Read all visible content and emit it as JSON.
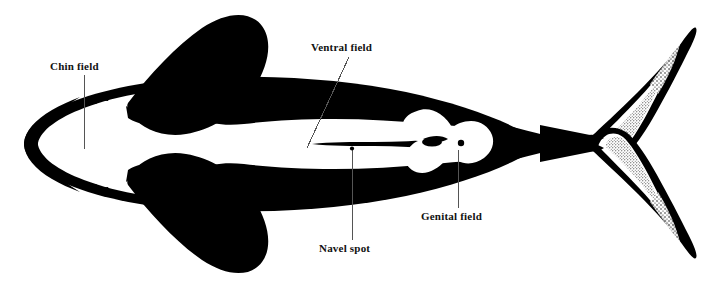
{
  "figure": {
    "background_color": "#ffffff",
    "ink_color": "#000000",
    "leader_line_color": "#555555",
    "width": 713,
    "height": 288
  },
  "annotations": [
    {
      "id": "chin-field",
      "label": "Chin field",
      "label_x": 50,
      "label_y": 61,
      "leader": {
        "x1": 84,
        "y1": 75,
        "x2": 84,
        "y2": 149
      }
    },
    {
      "id": "ventral-field",
      "label": "Ventral field",
      "label_x": 311,
      "label_y": 42,
      "leader": {
        "x1": 349,
        "y1": 57,
        "x2": 307,
        "y2": 148
      }
    },
    {
      "id": "genital-field",
      "label": "Genital field",
      "label_x": 421,
      "label_y": 211,
      "leader": {
        "x1": 458,
        "y1": 150,
        "x2": 458,
        "y2": 208
      }
    },
    {
      "id": "navel-spot",
      "label": "Navel spot",
      "label_x": 319,
      "label_y": 243,
      "leader": {
        "x1": 352,
        "y1": 150,
        "x2": 352,
        "y2": 240
      },
      "marker": {
        "cx": 352,
        "cy": 149,
        "r": 2.1
      }
    }
  ],
  "anatomy_parts": [
    {
      "id": "body-silhouette",
      "name": "Body outline, ventral view"
    },
    {
      "id": "rostrum",
      "name": "Rostrum / snout"
    },
    {
      "id": "mouth-line-upper",
      "name": "Upper mouth line notch"
    },
    {
      "id": "mouth-line-lower",
      "name": "Lower mouth line notch"
    },
    {
      "id": "pectoral-fin-upper",
      "name": "Upper pectoral flipper"
    },
    {
      "id": "pectoral-fin-lower",
      "name": "Lower pectoral flipper"
    },
    {
      "id": "ventral-white-field",
      "name": "White ventral field"
    },
    {
      "id": "genital-white-patch",
      "name": "White genital field patch"
    },
    {
      "id": "genital-slit",
      "name": "Genital slit"
    },
    {
      "id": "mammary-slit-left",
      "name": "Mammary slit"
    },
    {
      "id": "anus-spot",
      "name": "Anal opening spot"
    },
    {
      "id": "peduncle",
      "name": "Caudal peduncle"
    },
    {
      "id": "tail-fluke-upper",
      "name": "Upper tail fluke lobe"
    },
    {
      "id": "tail-fluke-lower",
      "name": "Lower tail fluke lobe"
    }
  ]
}
